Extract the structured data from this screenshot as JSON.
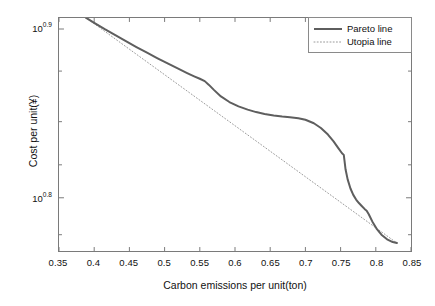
{
  "chart_data": {
    "type": "line",
    "title": "",
    "xlabel": "Carbon emissions per unit(ton)",
    "ylabel": "Cost per unit(¥)",
    "xlim": [
      0.35,
      0.85
    ],
    "ylim_log10": [
      0.7685,
      0.9065
    ],
    "yscale": "log",
    "grid": false,
    "legend_position": "top-right",
    "xticks": [
      "0.35",
      "0.4",
      "0.45",
      "0.5",
      "0.55",
      "0.6",
      "0.65",
      "0.7",
      "0.75",
      "0.8",
      "0.85"
    ],
    "xtick_values": [
      0.35,
      0.4,
      0.45,
      0.5,
      0.55,
      0.6,
      0.65,
      0.7,
      0.75,
      0.8,
      0.85
    ],
    "yticks": [
      "10",
      "10"
    ],
    "ytick_exponents": [
      "0.9",
      "0.8"
    ],
    "ytick_values": [
      7.943,
      6.31
    ],
    "series": [
      {
        "name": "Pareto line",
        "style": "solid",
        "color": "#5e5e5e",
        "width": 2.0,
        "x": [
          0.388,
          0.4,
          0.415,
          0.43,
          0.445,
          0.46,
          0.475,
          0.49,
          0.505,
          0.52,
          0.532,
          0.542,
          0.55,
          0.557,
          0.563,
          0.57,
          0.58,
          0.592,
          0.605,
          0.618,
          0.63,
          0.642,
          0.655,
          0.667,
          0.678,
          0.69,
          0.7,
          0.712,
          0.722,
          0.732,
          0.74,
          0.747,
          0.752,
          0.7545,
          0.7555,
          0.757,
          0.76,
          0.764,
          0.768,
          0.772,
          0.776,
          0.78,
          0.784,
          0.787,
          0.79,
          0.795,
          0.801,
          0.808,
          0.816,
          0.824,
          0.83
        ],
        "y": [
          8.068,
          8.01,
          7.941,
          7.876,
          7.812,
          7.75,
          7.69,
          7.632,
          7.576,
          7.522,
          7.48,
          7.447,
          7.422,
          7.398,
          7.36,
          7.31,
          7.245,
          7.19,
          7.148,
          7.116,
          7.092,
          7.074,
          7.06,
          7.05,
          7.043,
          7.033,
          7.018,
          6.985,
          6.94,
          6.878,
          6.815,
          6.75,
          6.705,
          6.69,
          6.64,
          6.56,
          6.47,
          6.39,
          6.335,
          6.295,
          6.265,
          6.24,
          6.215,
          6.2,
          6.17,
          6.11,
          6.05,
          6.0,
          5.962,
          5.94,
          5.932
        ]
      },
      {
        "name": "Utopia line",
        "style": "dotted",
        "color": "#9a9a9a",
        "width": 1.0,
        "x": [
          0.388,
          0.83
        ],
        "y": [
          8.068,
          5.932
        ]
      }
    ]
  },
  "axes": {
    "xlabel": "Carbon emissions per unit(ton)",
    "ylabel": "Cost per unit(¥)",
    "xticks": [
      {
        "label": "0.35",
        "value": 0.35
      },
      {
        "label": "0.4",
        "value": 0.4
      },
      {
        "label": "0.45",
        "value": 0.45
      },
      {
        "label": "0.5",
        "value": 0.5
      },
      {
        "label": "0.55",
        "value": 0.55
      },
      {
        "label": "0.6",
        "value": 0.6
      },
      {
        "label": "0.65",
        "value": 0.65
      },
      {
        "label": "0.7",
        "value": 0.7
      },
      {
        "label": "0.75",
        "value": 0.75
      },
      {
        "label": "0.8",
        "value": 0.8
      },
      {
        "label": "0.85",
        "value": 0.85
      }
    ],
    "yticks": [
      {
        "base": "10",
        "exponent": "0.9",
        "value": 7.943
      },
      {
        "base": "10",
        "exponent": "0.8",
        "value": 6.31
      }
    ]
  },
  "legend": {
    "entries": [
      {
        "label": "Pareto line",
        "style": "solid",
        "color": "#5e5e5e"
      },
      {
        "label": "Utopia line",
        "style": "dotted",
        "color": "#9a9a9a"
      }
    ]
  },
  "colors": {
    "pareto": "#5e5e5e",
    "utopia": "#9a9a9a",
    "axis": "#7a7a7a",
    "text": "#111111",
    "background": "#ffffff"
  }
}
